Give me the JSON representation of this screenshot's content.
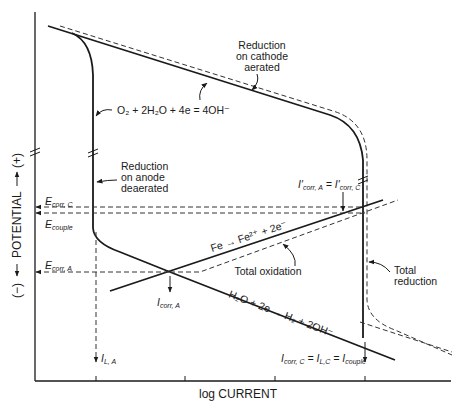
{
  "diagram": {
    "type": "polarization-diagram",
    "axes": {
      "x_label": "log CURRENT",
      "y_label": "(−) ← POTENTIAL → (+)",
      "y_label_neg": "(−)",
      "y_label_word": "POTENTIAL",
      "y_label_pos": "(+)"
    },
    "curve_labels": {
      "reduction_cathode": [
        "Reduction",
        "on cathode",
        "aerated"
      ],
      "reduction_anode": [
        "Reduction",
        "on anode",
        "deaerated"
      ],
      "oxygen_reaction": "O₂ + 2H₂O + 4e = 4OH⁻",
      "iron_oxidation": "Fe → Fe²⁺ + 2e⁻",
      "water_reduction": "H₂O + 2e → H₂ + 2OH⁻",
      "total_oxidation": "Total oxidation",
      "total_reduction": [
        "Total",
        "reduction"
      ]
    },
    "potential_markers": {
      "e_corr_c": {
        "main": "E",
        "sub": "corr, C"
      },
      "e_couple": {
        "main": "E",
        "sub": "couple"
      },
      "e_corr_a": {
        "main": "E",
        "sub": "corr, A"
      }
    },
    "current_markers": {
      "i_corr_a": {
        "main": "I",
        "sub": "corr, A"
      },
      "i_l_a": {
        "main": "I",
        "sub": "L, A"
      },
      "i_prime_equal": {
        "left_main": "I′",
        "left_sub": "corr, A",
        "eq": " = ",
        "right_main": "I′",
        "right_sub": "corr, C"
      },
      "i_couple_equal": {
        "a_main": "I",
        "a_sub": "corr, C",
        "b_main": "I",
        "b_sub": "L,C",
        "c_main": "I",
        "c_sub": "couple",
        "eq": " = "
      }
    },
    "colors": {
      "line": "#1a1a1a",
      "background": "#ffffff"
    }
  }
}
